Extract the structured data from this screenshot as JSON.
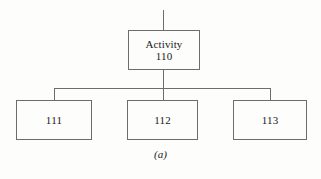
{
  "figure": {
    "caption": "(a)",
    "background_color": "#fdfdfc",
    "line_color": "#6d6d6d",
    "text_color": "#1a1a1a"
  },
  "diagram": {
    "type": "work-breakdown-tree",
    "parent": {
      "label": "Activity",
      "code": "110"
    },
    "children": [
      {
        "code": "111"
      },
      {
        "code": "112"
      },
      {
        "code": "113"
      }
    ]
  }
}
